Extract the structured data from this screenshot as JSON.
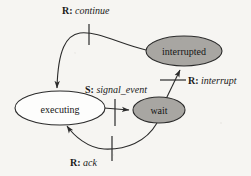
{
  "diagram": {
    "type": "state-transition-diagram",
    "background_color": "#f6f5f2",
    "stroke_color": "#2b2b2b",
    "states": [
      {
        "id": "executing",
        "label": "executing",
        "fill": "#ffffff",
        "cx": 60,
        "cy": 108,
        "rx": 45,
        "ry": 17
      },
      {
        "id": "interrupted",
        "label": "interrupted",
        "fill": "#a8a6a2",
        "cx": 184,
        "cy": 51,
        "rx": 38,
        "ry": 15
      },
      {
        "id": "wait",
        "label": "wait",
        "fill": "#a8a6a2",
        "cx": 159,
        "cy": 110,
        "rx": 26,
        "ry": 13
      }
    ],
    "transitions": [
      {
        "id": "continue",
        "kind": "R",
        "kind_label": "R:",
        "event": "continue",
        "from": "interrupted",
        "to": "executing",
        "label_x": 62,
        "label_y": 5,
        "tick": {
          "x1": 89,
          "y1": 24,
          "x2": 89,
          "y2": 45
        }
      },
      {
        "id": "interrupt",
        "kind": "R",
        "kind_label": "R:",
        "event": "interrupt",
        "from": "wait",
        "to": "interrupted",
        "label_x": 188,
        "label_y": 75,
        "tick": {
          "x1": 160,
          "y1": 80,
          "x2": 185,
          "y2": 80
        }
      },
      {
        "id": "signal_event",
        "kind": "S",
        "kind_label": "S:",
        "event": "signal_event",
        "from": "executing",
        "to": "wait",
        "label_x": 85,
        "label_y": 84,
        "tick": {
          "x1": 115,
          "y1": 99,
          "x2": 115,
          "y2": 126
        }
      },
      {
        "id": "ack",
        "kind": "R",
        "kind_label": "R:",
        "event": "ack",
        "from": "wait",
        "to": "executing",
        "label_x": 70,
        "label_y": 157,
        "tick": {
          "x1": 112,
          "y1": 136,
          "x2": 112,
          "y2": 161
        }
      }
    ]
  }
}
